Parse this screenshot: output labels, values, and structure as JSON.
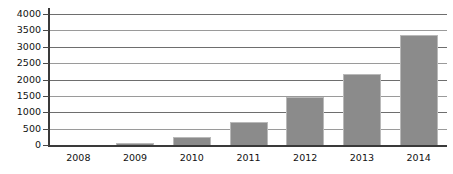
{
  "chart_data": {
    "type": "bar",
    "title": "",
    "subtitle": "",
    "xlabel": "",
    "ylabel": "",
    "categories": [
      "2008",
      "2009",
      "2010",
      "2011",
      "2012",
      "2013",
      "2014"
    ],
    "values": [
      0,
      60,
      250,
      700,
      1480,
      2180,
      3350
    ],
    "series": [
      {
        "name": "",
        "values": [
          0,
          60,
          250,
          700,
          1480,
          2180,
          3350
        ]
      }
    ],
    "ylim": [
      0,
      4000
    ],
    "yticks": [
      0,
      500,
      1000,
      1500,
      2000,
      2500,
      3000,
      3500,
      4000
    ],
    "ytick_labels": [
      "0",
      "500",
      "1000",
      "1500",
      "2000",
      "2500",
      "3000",
      "3500",
      "4000"
    ],
    "grid": true,
    "grid_axis": "y",
    "legend": false,
    "legend_position": "none",
    "annotations": [],
    "colors": {
      "bar_fill": "#8b8b8b",
      "bar_border": "#b9b9b9",
      "gridline": "#6e6e6e",
      "gridline_light": "#9a9a9a",
      "axis": "#3a3a3a",
      "text": "#111111",
      "background": "#ffffff"
    }
  }
}
